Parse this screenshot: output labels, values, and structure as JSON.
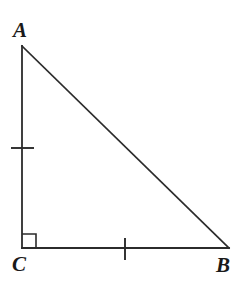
{
  "figure": {
    "background_color": "#ffffff",
    "stroke_color": "#2b2b2b",
    "stroke_width": 1.6,
    "canvas": {
      "width": 243,
      "height": 292
    },
    "vertices": [
      {
        "name": "A",
        "label": "A",
        "x": 22,
        "y": 46,
        "label_x": 13,
        "label_y": 20
      },
      {
        "name": "C",
        "label": "C",
        "x": 22,
        "y": 248,
        "label_x": 12,
        "label_y": 254
      },
      {
        "name": "B",
        "label": "B",
        "x": 229,
        "y": 248,
        "label_x": 216,
        "label_y": 255
      }
    ],
    "sides": [
      {
        "name": "AC",
        "from": "A",
        "to": "C",
        "x1": 22,
        "y1": 46,
        "x2": 22,
        "y2": 248,
        "tick_count": 1
      },
      {
        "name": "CB",
        "from": "C",
        "to": "B",
        "x1": 22,
        "y1": 248,
        "x2": 229,
        "y2": 248,
        "tick_count": 1
      },
      {
        "name": "AB",
        "from": "A",
        "to": "B",
        "x1": 22,
        "y1": 46,
        "x2": 229,
        "y2": 248,
        "tick_count": 0
      }
    ],
    "tick_marks": [
      {
        "on_side": "AC",
        "orientation": "horizontal",
        "x1": 11,
        "y1": 148,
        "x2": 34,
        "y2": 148
      },
      {
        "on_side": "CB",
        "orientation": "vertical",
        "x1": 125,
        "y1": 238,
        "x2": 125,
        "y2": 260
      }
    ],
    "right_angle": {
      "at_vertex": "C",
      "marker": "square",
      "x": 22,
      "y": 234,
      "size": 14
    }
  }
}
